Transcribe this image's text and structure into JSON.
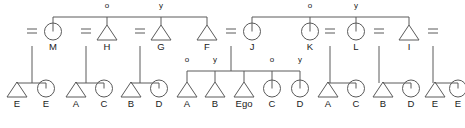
{
  "diagram": {
    "type": "kinship-pedigree",
    "ego_label": "Ego",
    "marriage_symbol": "=",
    "line_color": "#5a5a5a",
    "text_color": "#1a1a1a",
    "background": "#ffffff",
    "marker_older": "o",
    "marker_younger": "y"
  },
  "generations": {
    "parent_row": {
      "name": "parent-generation",
      "nodes": [
        {
          "id": "p0",
          "shape": "marriage",
          "label": "=",
          "x": 32,
          "y": 40
        },
        {
          "id": "p1",
          "shape": "circle",
          "label": "M",
          "x": 53,
          "y": 40
        },
        {
          "id": "p2",
          "shape": "marriage",
          "label": "=",
          "x": 86,
          "y": 40
        },
        {
          "id": "p3",
          "shape": "triangle",
          "label": "H",
          "x": 107,
          "y": 40,
          "marker": "o"
        },
        {
          "id": "p4",
          "shape": "marriage",
          "label": "=",
          "x": 140,
          "y": 40
        },
        {
          "id": "p5",
          "shape": "triangle",
          "label": "G",
          "x": 161,
          "y": 40,
          "marker": "y"
        },
        {
          "id": "p6",
          "shape": "triangle",
          "label": "F",
          "x": 207,
          "y": 40
        },
        {
          "id": "p7",
          "shape": "marriage",
          "label": "=",
          "x": 231,
          "y": 40
        },
        {
          "id": "p8",
          "shape": "circle",
          "label": "J",
          "x": 252,
          "y": 40
        },
        {
          "id": "p9",
          "shape": "circle",
          "label": "K",
          "x": 310,
          "y": 40,
          "marker": "o"
        },
        {
          "id": "p10",
          "shape": "marriage",
          "label": "=",
          "x": 330,
          "y": 40
        },
        {
          "id": "p11",
          "shape": "circle",
          "label": "L",
          "x": 356,
          "y": 40,
          "marker": "y"
        },
        {
          "id": "p12",
          "shape": "marriage",
          "label": "=",
          "x": 379,
          "y": 40
        },
        {
          "id": "p13",
          "shape": "triangle",
          "label": "I",
          "x": 409,
          "y": 40
        },
        {
          "id": "p14",
          "shape": "marriage",
          "label": "=",
          "x": 433,
          "y": 40
        }
      ],
      "sibling_bars": [
        {
          "name": "sibling-bar-left",
          "x1": 53,
          "x2": 207,
          "y": 17,
          "members": [
            "M",
            "H",
            "G",
            "F"
          ]
        },
        {
          "name": "sibling-bar-right",
          "x1": 252,
          "x2": 409,
          "y": 17,
          "members": [
            "J",
            "K",
            "L",
            "I"
          ]
        }
      ]
    },
    "ego_row": {
      "name": "ego-generation",
      "nodes": [
        {
          "id": "c0",
          "shape": "triangle",
          "label": "E",
          "x": 17,
          "y": 97
        },
        {
          "id": "c1",
          "shape": "circle",
          "label": "E",
          "x": 46,
          "y": 97
        },
        {
          "id": "c2",
          "shape": "triangle",
          "label": "A",
          "x": 76,
          "y": 97
        },
        {
          "id": "c3",
          "shape": "circle",
          "label": "C",
          "x": 104,
          "y": 97
        },
        {
          "id": "c4",
          "shape": "triangle",
          "label": "B",
          "x": 131,
          "y": 97
        },
        {
          "id": "c5",
          "shape": "circle",
          "label": "D",
          "x": 159,
          "y": 97
        },
        {
          "id": "c6",
          "shape": "triangle",
          "label": "A",
          "x": 187,
          "y": 97,
          "marker": "o"
        },
        {
          "id": "c7",
          "shape": "triangle",
          "label": "B",
          "x": 215,
          "y": 97,
          "marker": "y"
        },
        {
          "id": "c8",
          "shape": "triangle",
          "label": "Ego",
          "x": 244,
          "y": 97
        },
        {
          "id": "c9",
          "shape": "circle",
          "label": "C",
          "x": 272,
          "y": 97,
          "marker": "o"
        },
        {
          "id": "c10",
          "shape": "circle",
          "label": "D",
          "x": 300,
          "y": 97,
          "marker": "y"
        },
        {
          "id": "c11",
          "shape": "triangle",
          "label": "A",
          "x": 328,
          "y": 97
        },
        {
          "id": "c12",
          "shape": "circle",
          "label": "C",
          "x": 356,
          "y": 97
        },
        {
          "id": "c13",
          "shape": "triangle",
          "label": "B",
          "x": 383,
          "y": 97
        },
        {
          "id": "c14",
          "shape": "circle",
          "label": "D",
          "x": 411,
          "y": 97
        },
        {
          "id": "c15",
          "shape": "triangle",
          "label": "E",
          "x": 435,
          "y": 97
        },
        {
          "id": "c16",
          "shape": "circle",
          "label": "E",
          "x": 458,
          "y": 97
        }
      ],
      "sibling_bars": [
        {
          "name": "sibling-bar-1",
          "x1": 17,
          "x2": 46,
          "y": 83,
          "members": [
            "E",
            "E"
          ]
        },
        {
          "name": "sibling-bar-2",
          "x1": 76,
          "x2": 104,
          "y": 83,
          "members": [
            "A",
            "C"
          ]
        },
        {
          "name": "sibling-bar-3",
          "x1": 131,
          "x2": 159,
          "y": 83,
          "members": [
            "B",
            "D"
          ]
        },
        {
          "name": "sibling-bar-ego",
          "x1": 187,
          "x2": 300,
          "y": 71,
          "members": [
            "A",
            "B",
            "Ego",
            "C",
            "D"
          ]
        },
        {
          "name": "sibling-bar-4",
          "x1": 328,
          "x2": 356,
          "y": 83,
          "members": [
            "A",
            "C"
          ]
        },
        {
          "name": "sibling-bar-5",
          "x1": 383,
          "x2": 411,
          "y": 83,
          "members": [
            "B",
            "D"
          ]
        },
        {
          "name": "sibling-bar-6",
          "x1": 435,
          "x2": 458,
          "y": 83,
          "members": [
            "E",
            "E"
          ]
        }
      ]
    }
  },
  "descent_lines": [
    {
      "name": "descent-from-marriage-1",
      "x": 32,
      "y1": 46,
      "y2": 83
    },
    {
      "name": "descent-from-marriage-2",
      "x": 86,
      "y1": 46,
      "y2": 83
    },
    {
      "name": "descent-from-marriage-3",
      "x": 140,
      "y1": 46,
      "y2": 83
    },
    {
      "name": "descent-from-marriage-4",
      "x": 231,
      "y1": 46,
      "y2": 71
    },
    {
      "name": "descent-from-marriage-5",
      "x": 330,
      "y1": 46,
      "y2": 83
    },
    {
      "name": "descent-from-marriage-6",
      "x": 379,
      "y1": 46,
      "y2": 83
    },
    {
      "name": "descent-from-marriage-7",
      "x": 433,
      "y1": 46,
      "y2": 83
    }
  ]
}
